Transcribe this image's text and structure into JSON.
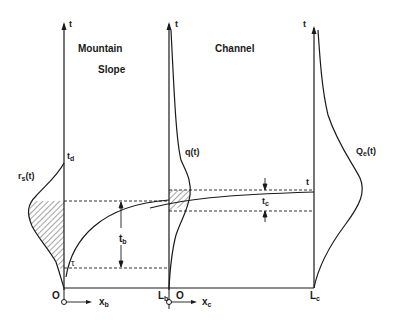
{
  "labels": {
    "mountain": "Mountain",
    "slope": "Slope",
    "channel": "Channel",
    "t_axis_left": "t",
    "t_axis_mid": "t",
    "t_axis_right": "t",
    "td": "t",
    "td_sub": "d",
    "rs": "r",
    "rs_sub": "s",
    "rs_arg": "(t)",
    "q": "q(t)",
    "qe": "Q",
    "qe_sub": "e",
    "qe_arg": "(t)",
    "tb": "t",
    "tb_sub": "b",
    "tc": "t",
    "tc_sub": "c",
    "t_marker": "t",
    "tau": "τ",
    "origin_left": "O",
    "origin_mid": "O",
    "xb": "x",
    "xb_sub": "b",
    "xc": "x",
    "xc_sub": "c",
    "lb": "L",
    "lb_sub": "b",
    "lc": "L",
    "lc_sub": "c"
  },
  "colors": {
    "ink": "#1a1a1a",
    "background": "#ffffff"
  }
}
